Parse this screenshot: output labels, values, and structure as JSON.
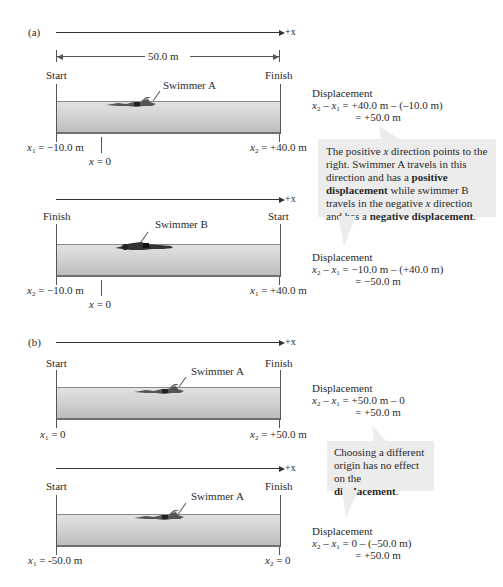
{
  "figure": {
    "part_a": {
      "label": "(a)",
      "axis_label": "+x",
      "dimension_label": "50.0 m",
      "scene_a": {
        "left_label": "Start",
        "right_label": "Finish",
        "swimmer_label": "Swimmer A",
        "left_pos": "x1 = −10.0 m",
        "left_pos_var": "x",
        "left_pos_sub": "1",
        "left_pos_val": " = −10.0 m",
        "origin_label_var": "x",
        "origin_label_val": " = 0",
        "right_pos_var": "x",
        "right_pos_sub": "2",
        "right_pos_val": " = +40.0 m",
        "displacement": {
          "title": "Displacement",
          "line1_rest": " = +40.0 m – (–10.0 m)",
          "line2": "= +50.0 m"
        }
      },
      "callout": {
        "t1": "The positive ",
        "t1_var": "x",
        "t2": " direction points to the right. Swimmer A travels in this direction and has a ",
        "b1": "positive displacement",
        "t3": " while swimmer B travels in the negative ",
        "t3_var": "x",
        "t4": " direction and has a ",
        "b2": "negative displacement",
        "t5": "."
      },
      "scene_b": {
        "axis_label": "+x",
        "left_label": "Finish",
        "right_label": "Start",
        "swimmer_label": "Swimmer B",
        "left_pos_var": "x",
        "left_pos_sub": "2",
        "left_pos_val": " = −10.0 m",
        "origin_label_var": "x",
        "origin_label_val": " = 0",
        "right_pos_var": "x",
        "right_pos_sub": "1",
        "right_pos_val": " = +40.0 m",
        "displacement": {
          "title": "Displacement",
          "line1_rest": " = −10.0 m – (+40.0 m)",
          "line2": "= −50.0 m"
        }
      }
    },
    "part_b": {
      "label": "(b)",
      "scene_a": {
        "axis_label": "+x",
        "left_label": "Start",
        "right_label": "Finish",
        "swimmer_label": "Swimmer A",
        "left_pos_var": "x",
        "left_pos_sub": "1",
        "left_pos_val": " = 0",
        "right_pos_var": "x",
        "right_pos_sub": "2",
        "right_pos_val": " = +50.0 m",
        "displacement": {
          "title": "Displacement",
          "line1_rest": " = +50.0 m – 0",
          "line2": "= +50.0 m"
        }
      },
      "callout": {
        "t1": "Choosing a different origin has no effect on the ",
        "b1": "displacement",
        "t2": "."
      },
      "scene_b": {
        "axis_label": "+x",
        "left_label": "Start",
        "right_label": "Finish",
        "swimmer_label": "Swimmer A",
        "left_pos_var": "x",
        "left_pos_sub": "1",
        "left_pos_val": " = -50.0 m",
        "right_pos_var": "x",
        "right_pos_sub": "2",
        "right_pos_val": " = 0",
        "displacement": {
          "title": "Displacement",
          "line1_rest": " = 0 – (–50.0 m)",
          "line2": "= +50.0 m"
        }
      }
    },
    "colors": {
      "water_top": "#e2e2e2",
      "water_bottom": "#bdbdbd",
      "callout_bg": "#ececec",
      "line": "#333333"
    }
  }
}
